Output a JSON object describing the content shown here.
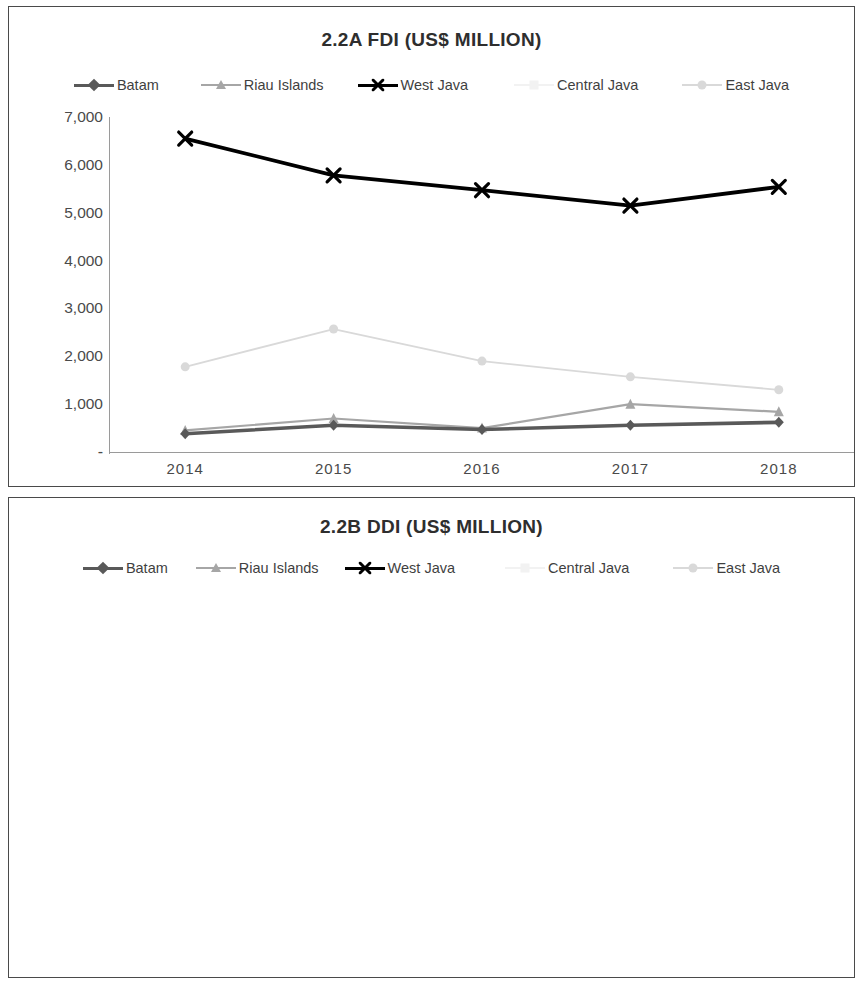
{
  "page": {
    "background": "#ffffff",
    "panel_border_color": "#4a4a4a"
  },
  "series_styles": {
    "batam": {
      "label": "Batam",
      "color": "#595959",
      "marker": "diamond",
      "width": 3.6
    },
    "riau": {
      "label": "Riau Islands",
      "color": "#a6a6a6",
      "marker": "triangle",
      "width": 2.2
    },
    "west_java": {
      "label": "West Java",
      "color": "#000000",
      "marker": "x",
      "width": 3.8
    },
    "central_java": {
      "label": "Central Java",
      "color": "#f2f2f2",
      "marker": "square",
      "width": 1.6
    },
    "east_java": {
      "label": "East Java",
      "color": "#d9d9d9",
      "marker": "circle",
      "width": 1.8
    }
  },
  "chart_a": {
    "title": "2.2A FDI (US$ MILLION)",
    "legend": [
      "Batam",
      "Riau Islands",
      "West Java",
      "Central Java",
      "East Java"
    ],
    "ylabels": [
      "7,000",
      "6,000",
      "5,000",
      "4,000",
      "3,000",
      "2,000",
      "1,000",
      "-"
    ],
    "xlabels": [
      "2014",
      "2015",
      "2016",
      "2017",
      "2018"
    ]
  },
  "chart_b": {
    "title": "2.2B DDI (US$ MILLION)",
    "legend": [
      "Batam",
      "Riau Islands",
      "West Java",
      "Central Java",
      "East Java"
    ],
    "ylabels": [
      "4,000",
      "3,500",
      "3,000",
      "2,500",
      "2,000",
      "1,500",
      "1,000",
      "500",
      "-"
    ],
    "xlabels": [
      "2014",
      "2015",
      "2016",
      "2017",
      "2018"
    ]
  },
  "chart_data": [
    {
      "type": "line",
      "id": "chart_a",
      "title": "2.2A FDI (US$ MILLION)",
      "xlabel": "",
      "ylabel": "",
      "x": [
        "2014",
        "2015",
        "2016",
        "2017",
        "2018"
      ],
      "categories": [
        "2014",
        "2015",
        "2016",
        "2017",
        "2018"
      ],
      "ylim": [
        0,
        7000
      ],
      "yticks": [
        0,
        1000,
        2000,
        3000,
        4000,
        5000,
        6000,
        7000
      ],
      "ytick_labels": [
        "-",
        "1,000",
        "2,000",
        "3,000",
        "4,000",
        "5,000",
        "6,000",
        "7,000"
      ],
      "grid": false,
      "legend_position": "top",
      "series": [
        {
          "name": "Batam",
          "values": [
            380,
            560,
            470,
            560,
            620
          ]
        },
        {
          "name": "Riau Islands",
          "values": [
            450,
            700,
            500,
            1000,
            840
          ]
        },
        {
          "name": "West Java",
          "values": [
            6550,
            5780,
            5470,
            5150,
            5540
          ]
        },
        {
          "name": "Central Java",
          "values": [
            null,
            null,
            null,
            null,
            null
          ]
        },
        {
          "name": "East Java",
          "values": [
            1780,
            2570,
            1900,
            1570,
            1300
          ]
        }
      ]
    },
    {
      "type": "line",
      "id": "chart_b",
      "title": "2.2B DDI (US$ MILLION)",
      "xlabel": "",
      "ylabel": "",
      "x": [
        "2014",
        "2015",
        "2016",
        "2017",
        "2018"
      ],
      "categories": [
        "2014",
        "2015",
        "2016",
        "2017",
        "2018"
      ],
      "ylim": [
        0,
        4000
      ],
      "yticks": [
        0,
        500,
        1000,
        1500,
        2000,
        2500,
        3000,
        3500,
        4000
      ],
      "ytick_labels": [
        "-",
        "500",
        "1,000",
        "1,500",
        "2,000",
        "2,500",
        "3,000",
        "3,500",
        "4,000"
      ],
      "grid": false,
      "legend_position": "top",
      "series": [
        {
          "name": "Batam",
          "values": [
            40,
            30,
            25,
            70,
            220
          ]
        },
        {
          "name": "Riau Islands",
          "values": [
            60,
            40,
            55,
            90,
            290
          ]
        },
        {
          "name": "West Java",
          "values": [
            1570,
            1960,
            2290,
            2870,
            3060
          ]
        },
        {
          "name": "Central Java",
          "values": [
            null,
            null,
            null,
            null,
            null
          ]
        },
        {
          "name": "East Java",
          "values": [
            3210,
            2690,
            3490,
            3360,
            2410
          ]
        }
      ]
    }
  ]
}
